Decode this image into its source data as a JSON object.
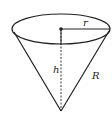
{
  "diagram": {
    "type": "cone",
    "labels": {
      "radius": "r",
      "height": "h",
      "slant": "R"
    },
    "colors": {
      "stroke": "#222222",
      "background": "#ffffff"
    }
  }
}
